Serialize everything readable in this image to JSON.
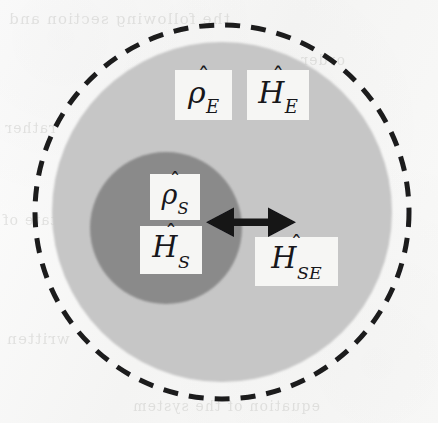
{
  "figure": {
    "name": "open-quantum-system-diagram",
    "background_color": "#f7f7f6"
  },
  "colors": {
    "paper": "#f7f7f6",
    "environment_fill": "#c6c6c6",
    "system_fill": "#8a8a8a",
    "boundary_stroke": "#1b1b1e",
    "arrow_fill": "#121215",
    "label_plate": "#f6f6f4",
    "label_text": "#17171a",
    "ghost_text": "#b9b9b6"
  },
  "shapes": {
    "universe_boundary": {
      "label": "universe-dashed-boundary",
      "shape": "circle",
      "cx": 222,
      "cy": 212,
      "r": 187,
      "stroke": "#1b1b1e",
      "stroke_width": 5,
      "dash": "15 11",
      "fill": "none"
    },
    "environment": {
      "label": "environment-circle",
      "shape": "circle",
      "cx": 222,
      "cy": 212,
      "r": 170,
      "fill": "#c6c6c6"
    },
    "system": {
      "label": "system-circle",
      "shape": "circle",
      "cx": 166,
      "cy": 228,
      "r": 76,
      "fill": "#8a8a8a"
    },
    "coupling_arrow": {
      "label": "coupling-double-arrow",
      "shape": "double-headed-arrow",
      "x1": 210,
      "x2": 292,
      "y": 222,
      "shaft_thickness": 7,
      "head_length": 26,
      "head_half_width": 15,
      "fill": "#121215"
    }
  },
  "labels": {
    "environment_state": {
      "name": "label-rho-e",
      "base": "ρ",
      "accent": "̂",
      "subscript": "E",
      "plain": "ρ̂_E",
      "meaning": "environment density operator"
    },
    "environment_hamiltonian": {
      "name": "label-h-e",
      "base": "H",
      "accent": "̂",
      "subscript": "E",
      "plain": "Ĥ_E",
      "meaning": "environment Hamiltonian"
    },
    "system_state": {
      "name": "label-rho-s",
      "base": "ρ",
      "accent": "̂",
      "subscript": "S",
      "plain": "ρ̂_S",
      "meaning": "system density operator"
    },
    "system_hamiltonian": {
      "name": "label-h-s",
      "base": "H",
      "accent": "̂",
      "subscript": "S",
      "plain": "Ĥ_S",
      "meaning": "system Hamiltonian"
    },
    "interaction_hamiltonian": {
      "name": "label-h-se",
      "base": "H",
      "accent": "̂",
      "subscript": "SE",
      "plain": "Ĥ_SE",
      "meaning": "system-environment interaction Hamiltonian"
    }
  },
  "ghost_text": {
    "row_1": "the following  section  and",
    "row_2": "order",
    "row_3": "rather",
    "row_4": "state of",
    "row_5": "written",
    "row_6": "equation  of  the  system"
  }
}
